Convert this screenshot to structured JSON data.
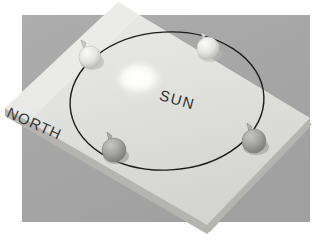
{
  "scene": {
    "title": "Earth orbit model photograph",
    "description": "Photograph of a physical classroom model: a tilted light-gray board showing the Earth's elliptical orbit around the Sun with four globes marking seasonal positions.",
    "background_color": "#ffffff",
    "backdrop_color": "#a8a8a8",
    "board_face_color": "#e3e3e1",
    "board_edge_color": "#b9b9b7",
    "orbit_line_color": "#1b1b1b",
    "sun_color": "#fbfbf7"
  },
  "labels": {
    "north": "NORTH",
    "sun": "SUN"
  },
  "sun": {
    "name": "sun-disc",
    "cx": 140,
    "cy": 80,
    "rx": 21,
    "ry": 15
  },
  "orbit": {
    "name": "orbit-ellipse",
    "cx": 167,
    "cy": 101,
    "rx": 97,
    "ry": 69,
    "rotation_deg": -3,
    "stroke_width": 1.4
  },
  "globes": [
    {
      "name": "globe-top-left",
      "position": "top-left",
      "cx": 90,
      "cy": 57,
      "r": 11,
      "fill": "#e8e8e6",
      "shade": "#c5c5c2",
      "pin_angle_deg": -28,
      "pin_length": 9
    },
    {
      "name": "globe-top-right",
      "position": "top-right",
      "cx": 208,
      "cy": 48,
      "r": 11,
      "fill": "#eeeeec",
      "shade": "#cccccA",
      "pin_angle_deg": -22,
      "pin_length": 8
    },
    {
      "name": "globe-bottom-right",
      "position": "right",
      "cx": 254,
      "cy": 141,
      "r": 12,
      "fill": "#a9a9a6",
      "shade": "#8b8b88",
      "pin_angle_deg": -20,
      "pin_length": 9
    },
    {
      "name": "globe-bottom-left",
      "position": "bottom-left",
      "cx": 114,
      "cy": 150,
      "r": 12,
      "fill": "#9f9f9c",
      "shade": "#848481",
      "pin_angle_deg": -24,
      "pin_length": 8
    }
  ],
  "backdrop": {
    "name": "gray-backdrop",
    "x": 22,
    "y": 15,
    "width": 288,
    "height": 207
  },
  "board": {
    "name": "model-board",
    "top_corner": [
      118,
      2
    ],
    "left_corner": [
      5,
      108
    ],
    "bottom_corner": [
      207,
      225
    ],
    "right_corner": [
      310,
      118
    ],
    "thickness": 9
  }
}
